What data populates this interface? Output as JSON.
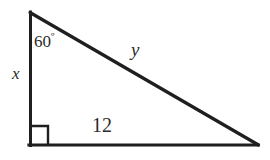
{
  "figure": {
    "kind": "right-triangle-diagram",
    "background_color": "#ffffff",
    "stroke_color": "#1f1f1f",
    "text_color": "#2b2b2b",
    "labels": {
      "angle_value": "60",
      "angle_degree_symbol": "º",
      "vertical_leg": "x",
      "hypotenuse": "y",
      "horizontal_leg": "12"
    },
    "geometry": {
      "apex": [
        30,
        12
      ],
      "right_angle_vertex": [
        30,
        145
      ],
      "base_vertex": [
        258,
        145
      ],
      "right_angle_marker_size": 18,
      "stroke_width": 3
    }
  }
}
